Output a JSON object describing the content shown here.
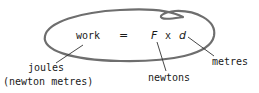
{
  "diagram": {
    "equation": {
      "lhs": "work",
      "equals": "=",
      "force": "F",
      "times": "x",
      "distance": "d"
    },
    "annotations": {
      "work_unit_line1": "joules",
      "work_unit_line2": "(newton metres)",
      "force_unit": "newtons",
      "distance_unit": "metres"
    },
    "colors": {
      "stroke": "#6e6e6e",
      "text": "#1a1a1a",
      "background": "#ffffff"
    }
  }
}
